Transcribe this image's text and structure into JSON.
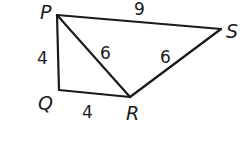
{
  "diagram": {
    "type": "geometry",
    "vertices": [
      {
        "name": "P",
        "x": 57,
        "y": 15,
        "label_x": 40,
        "label_y": 19
      },
      {
        "name": "Q",
        "x": 59,
        "y": 90,
        "label_x": 38,
        "label_y": 110
      },
      {
        "name": "R",
        "x": 130,
        "y": 97,
        "label_x": 126,
        "label_y": 120
      },
      {
        "name": "S",
        "x": 221,
        "y": 29,
        "label_x": 226,
        "label_y": 38
      }
    ],
    "edges": [
      {
        "from": "P",
        "to": "S",
        "length": "9",
        "label_x": 134,
        "label_y": 15
      },
      {
        "from": "P",
        "to": "Q",
        "length": "4",
        "label_x": 37,
        "label_y": 64
      },
      {
        "from": "Q",
        "to": "R",
        "length": "4",
        "label_x": 82,
        "label_y": 118
      },
      {
        "from": "P",
        "to": "R",
        "length": "6",
        "label_x": 100,
        "label_y": 59
      },
      {
        "from": "R",
        "to": "S",
        "length": "6",
        "label_x": 160,
        "label_y": 63
      }
    ],
    "labels": {
      "P": "P",
      "Q": "Q",
      "R": "R",
      "S": "S",
      "PS": "9",
      "PQ": "4",
      "QR": "4",
      "PR": "6",
      "RS": "6"
    },
    "line_color": "#1a1a1a"
  }
}
